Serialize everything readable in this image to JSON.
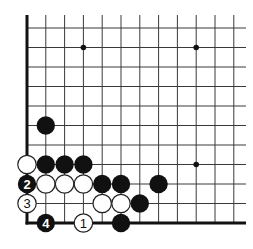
{
  "diagram": {
    "type": "go-board-corner",
    "view": "lower-left corner",
    "columns": 12,
    "rows": 11,
    "colors": {
      "black": "#111111",
      "white": "#ffffff",
      "line": "#3a3a3a",
      "background": "#ffffff"
    },
    "star_points": [
      {
        "col": 3,
        "row": 1
      },
      {
        "col": 9,
        "row": 1
      },
      {
        "col": 9,
        "row": 7
      }
    ],
    "stones": [
      {
        "color": "black",
        "col": 1,
        "row": 5,
        "label": ""
      },
      {
        "color": "white",
        "col": 0,
        "row": 7,
        "label": ""
      },
      {
        "color": "black",
        "col": 1,
        "row": 7,
        "label": ""
      },
      {
        "color": "black",
        "col": 2,
        "row": 7,
        "label": ""
      },
      {
        "color": "black",
        "col": 3,
        "row": 7,
        "label": ""
      },
      {
        "color": "black",
        "col": 0,
        "row": 8,
        "label": "2"
      },
      {
        "color": "white",
        "col": 1,
        "row": 8,
        "label": ""
      },
      {
        "color": "white",
        "col": 2,
        "row": 8,
        "label": ""
      },
      {
        "color": "white",
        "col": 3,
        "row": 8,
        "label": ""
      },
      {
        "color": "black",
        "col": 4,
        "row": 8,
        "label": ""
      },
      {
        "color": "black",
        "col": 5,
        "row": 8,
        "label": ""
      },
      {
        "color": "black",
        "col": 7,
        "row": 8,
        "label": ""
      },
      {
        "color": "white",
        "col": 0,
        "row": 9,
        "label": "3"
      },
      {
        "color": "white",
        "col": 4,
        "row": 9,
        "label": ""
      },
      {
        "color": "white",
        "col": 5,
        "row": 9,
        "label": ""
      },
      {
        "color": "black",
        "col": 6,
        "row": 9,
        "label": ""
      },
      {
        "color": "black",
        "col": 1,
        "row": 10,
        "label": "4"
      },
      {
        "color": "white",
        "col": 3,
        "row": 10,
        "label": "1"
      },
      {
        "color": "black",
        "col": 5,
        "row": 10,
        "label": ""
      }
    ]
  }
}
